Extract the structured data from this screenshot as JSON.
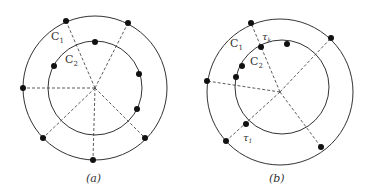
{
  "figure_a": {
    "caption": "(a)",
    "outer_label": "C",
    "outer_label_sub": "1",
    "inner_label": "C",
    "inner_label_sub": "2"
  },
  "figure_b": {
    "caption": "(b)",
    "outer_label": "C",
    "outer_label_sub": "1",
    "inner_label": "C",
    "inner_label_sub": "2",
    "point_label_top": "τ",
    "point_label_top_sub": "k",
    "point_label_bottom": "τ",
    "point_label_bottom_sub": "1"
  }
}
